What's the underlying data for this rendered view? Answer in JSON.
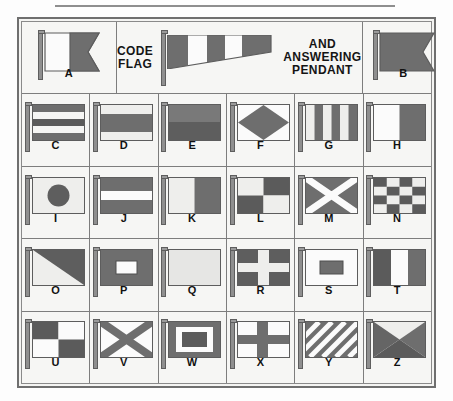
{
  "chart": {
    "title_lines_left": [
      "CODE",
      "FLAG"
    ],
    "title_lines_right": [
      "AND",
      "ANSWERING",
      "PENDANT"
    ],
    "colors": {
      "dark": "#6e6e6e",
      "light": "#f3f3f1",
      "outline": "#5d5d5d",
      "frame": "#6f6f6f",
      "background": "#f6f6f4",
      "staff": "#8f8f8f",
      "label": "#111111"
    },
    "header": {
      "flag_a": {
        "letter": "A",
        "pattern": "swallowtail-half-white-half-dark"
      },
      "flag_b": {
        "letter": "B",
        "pattern": "swallowtail-solid-dark"
      },
      "pendant": {
        "name": "code-and-answering-pendant",
        "bands": 5,
        "pattern": "tapering-pennant-alternating-dark-light"
      }
    },
    "rows": [
      [
        {
          "letter": "C",
          "pattern": "five-horizontal-stripes-dark-light-dark-light-dark"
        },
        {
          "letter": "D",
          "pattern": "three-horizontal-stripes-light-dark-light"
        },
        {
          "letter": "E",
          "pattern": "two-horizontal-bands-dark-dark"
        },
        {
          "letter": "F",
          "pattern": "dark-diamond-on-light"
        },
        {
          "letter": "G",
          "pattern": "six-vertical-stripes"
        },
        {
          "letter": "H",
          "pattern": "two-vertical-halves-light-dark"
        }
      ],
      [
        {
          "letter": "I",
          "pattern": "dark-circle-on-light"
        },
        {
          "letter": "J",
          "pattern": "three-horizontal-stripes-dark-light-dark"
        },
        {
          "letter": "K",
          "pattern": "two-vertical-halves-light-dark"
        },
        {
          "letter": "L",
          "pattern": "quartered-light-dark-dark-light"
        },
        {
          "letter": "M",
          "pattern": "light-saltire-on-dark"
        },
        {
          "letter": "N",
          "pattern": "four-by-four-checkerboard"
        }
      ],
      [
        {
          "letter": "O",
          "pattern": "diagonal-split-light-dark"
        },
        {
          "letter": "P",
          "pattern": "dark-field-light-rectangle-center"
        },
        {
          "letter": "Q",
          "pattern": "solid-light"
        },
        {
          "letter": "R",
          "pattern": "light-cross-on-dark"
        },
        {
          "letter": "S",
          "pattern": "light-field-dark-rectangle-center"
        },
        {
          "letter": "T",
          "pattern": "three-vertical-stripes-dark-light-dark"
        }
      ],
      [
        {
          "letter": "U",
          "pattern": "quartered-dark-light-light-dark"
        },
        {
          "letter": "V",
          "pattern": "dark-saltire-on-light"
        },
        {
          "letter": "W",
          "pattern": "dark-border-light-ring-dark-center"
        },
        {
          "letter": "X",
          "pattern": "dark-cross-on-light"
        },
        {
          "letter": "Y",
          "pattern": "diagonal-stripes-dark-light"
        },
        {
          "letter": "Z",
          "pattern": "four-triangles-light-top-dark-sides"
        }
      ]
    ]
  }
}
